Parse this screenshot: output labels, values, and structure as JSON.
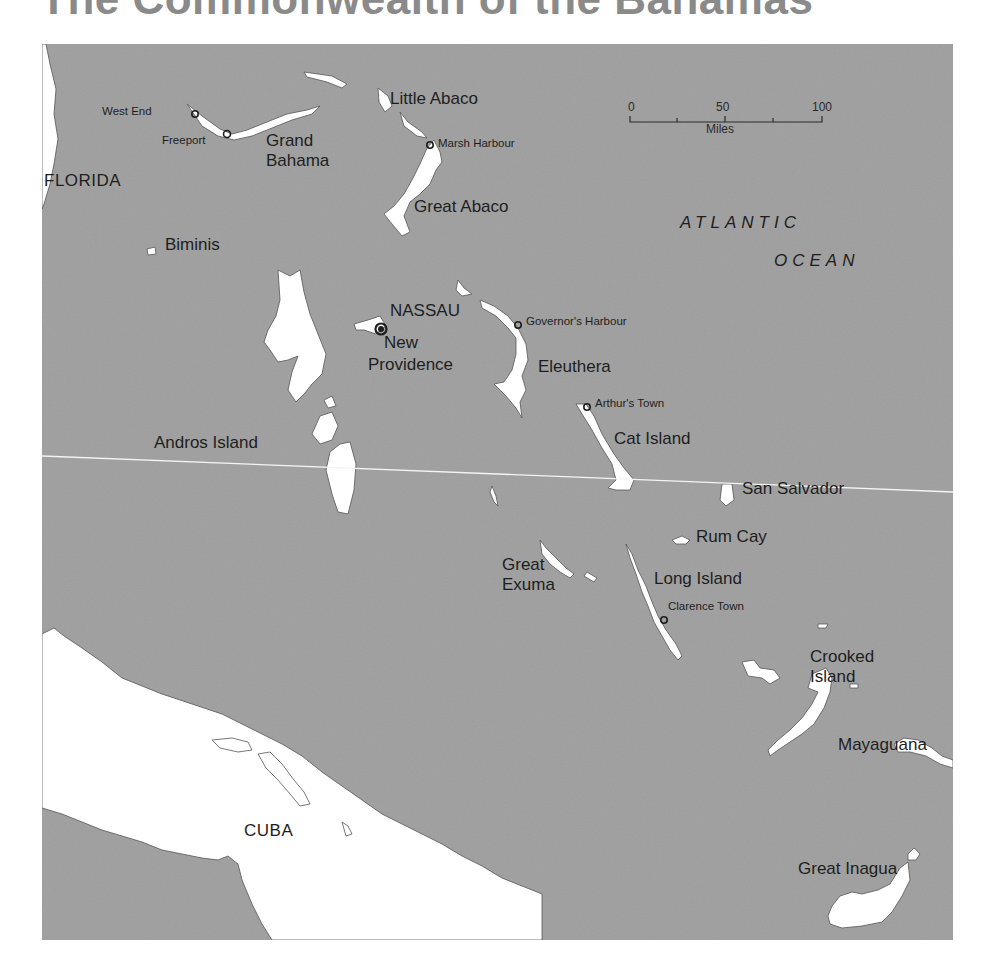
{
  "title": "The Commonwealth of the Bahamas",
  "colors": {
    "sea": "#9c9c9c",
    "land": "#ffffff",
    "text": "#1e1e1e",
    "gridline": "#f4f4f4"
  },
  "scale_bar": {
    "ticks": [
      "0",
      "50",
      "100"
    ],
    "unit": "Miles"
  },
  "labels": {
    "florida": "FLORIDA",
    "cuba": "CUBA",
    "atlantic": "ATLANTIC",
    "ocean": "OCEAN",
    "west_end": "West End",
    "freeport": "Freeport",
    "grand": "Grand",
    "bahama": "Bahama",
    "little_abaco": "Little Abaco",
    "marsh_harbour": "Marsh Harbour",
    "great_abaco": "Great Abaco",
    "biminis": "Biminis",
    "nassau": "NASSAU",
    "new": "New",
    "providence": "Providence",
    "governors_harbour": "Governor's Harbour",
    "eleuthera": "Eleuthera",
    "arthurs_town": "Arthur's Town",
    "cat_island": "Cat Island",
    "andros_island": "Andros Island",
    "san_salvador": "San Salvador",
    "rum_cay": "Rum Cay",
    "great_ex": "Great",
    "exuma": "Exuma",
    "long_island": "Long Island",
    "clarence_town": "Clarence Town",
    "crooked": "Crooked",
    "crooked_island": "Island",
    "mayaguana": "Mayaguana",
    "great_inagua": "Great Inagua"
  }
}
